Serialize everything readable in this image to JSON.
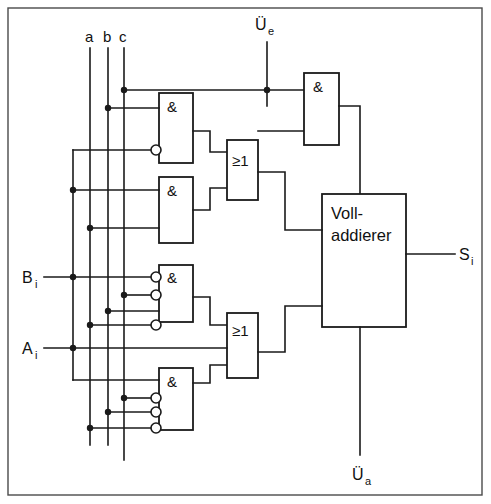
{
  "diagram": {
    "bus_labels": [
      {
        "name": "a",
        "x": 90
      },
      {
        "name": "b",
        "x": 108
      },
      {
        "name": "c",
        "x": 124
      }
    ],
    "inputs": [
      {
        "name": "B",
        "sub": "i"
      },
      {
        "name": "A",
        "sub": "i"
      },
      {
        "name": "Ü",
        "sub": "e"
      }
    ],
    "outputs": [
      {
        "name": "S",
        "sub": "i"
      },
      {
        "name": "Ü",
        "sub": "a"
      }
    ],
    "and_gates": [
      {
        "id": "and1",
        "symbol": "&"
      },
      {
        "id": "and2",
        "symbol": "&"
      },
      {
        "id": "and3",
        "symbol": "&"
      },
      {
        "id": "and4",
        "symbol": "&"
      },
      {
        "id": "and5",
        "symbol": "&"
      }
    ],
    "or_gates": [
      {
        "id": "or1",
        "symbol": "≥1"
      },
      {
        "id": "or2",
        "symbol": "≥1"
      }
    ],
    "adder_block": {
      "line1": "Voll-",
      "line2": "addierer"
    },
    "colors": {
      "wire": "#1a1a1a",
      "frame": "#4a4a4a",
      "background": "#ffffff"
    }
  }
}
